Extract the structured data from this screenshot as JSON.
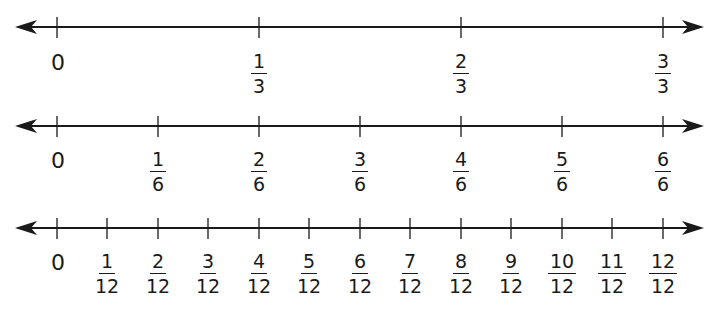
{
  "colors": {
    "line": "#1a1a1a",
    "background": "#ffffff"
  },
  "number_lines": [
    {
      "name": "thirds",
      "y": 27,
      "label_top": 52,
      "ticks": [
        {
          "x": 57,
          "whole": "0"
        },
        {
          "x": 259,
          "num": "1",
          "den": "3"
        },
        {
          "x": 461,
          "num": "2",
          "den": "3"
        },
        {
          "x": 663,
          "num": "3",
          "den": "3"
        }
      ]
    },
    {
      "name": "sixths",
      "y": 126,
      "label_top": 150,
      "ticks": [
        {
          "x": 57,
          "whole": "0"
        },
        {
          "x": 158,
          "num": "1",
          "den": "6"
        },
        {
          "x": 259,
          "num": "2",
          "den": "6"
        },
        {
          "x": 360,
          "num": "3",
          "den": "6"
        },
        {
          "x": 461,
          "num": "4",
          "den": "6"
        },
        {
          "x": 562,
          "num": "5",
          "den": "6"
        },
        {
          "x": 663,
          "num": "6",
          "den": "6"
        }
      ]
    },
    {
      "name": "twelfths",
      "y": 228,
      "label_top": 252,
      "ticks": [
        {
          "x": 57,
          "whole": "0"
        },
        {
          "x": 107,
          "num": "1",
          "den": "12"
        },
        {
          "x": 158,
          "num": "2",
          "den": "12"
        },
        {
          "x": 208,
          "num": "3",
          "den": "12"
        },
        {
          "x": 259,
          "num": "4",
          "den": "12"
        },
        {
          "x": 309,
          "num": "5",
          "den": "12"
        },
        {
          "x": 360,
          "num": "6",
          "den": "12"
        },
        {
          "x": 410,
          "num": "7",
          "den": "12"
        },
        {
          "x": 461,
          "num": "8",
          "den": "12"
        },
        {
          "x": 511,
          "num": "9",
          "den": "12"
        },
        {
          "x": 562,
          "num": "10",
          "den": "12"
        },
        {
          "x": 612,
          "num": "11",
          "den": "12"
        },
        {
          "x": 663,
          "num": "12",
          "den": "12"
        }
      ]
    }
  ]
}
